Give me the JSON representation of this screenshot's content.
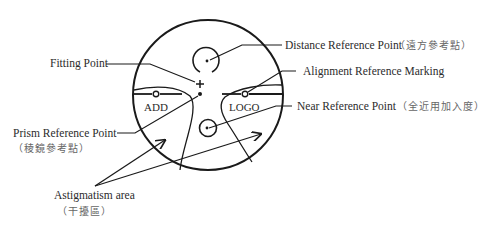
{
  "diagram": {
    "type": "progressive-lens-markings",
    "labels": {
      "fitting_point": "Fitting Point",
      "distance_ref": "Distance Reference Point",
      "distance_ref_cn": "（遠方參考點）",
      "alignment_ref": "Alignment Reference Marking",
      "near_ref": "Near Reference Point",
      "near_ref_cn": "（全近用加入度）",
      "prism_ref": "Prism Reference Point",
      "prism_ref_cn": "（稜鏡參考點）",
      "astigmatism": "Astigmatism area",
      "astigmatism_cn": "（干擾區）"
    },
    "lens_text": {
      "add": "ADD",
      "logo": "LOGO"
    },
    "colors": {
      "stroke": "#1a1a1a",
      "text": "#2b2b2b",
      "cjk_text": "#666666",
      "background": "#ffffff"
    }
  }
}
